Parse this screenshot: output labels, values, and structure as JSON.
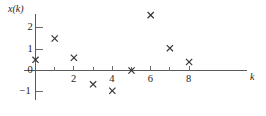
{
  "chart_data": {
    "type": "scatter",
    "title": "",
    "subtitle": "",
    "xlabel": "k",
    "ylabel": "x(k)",
    "marker": "x",
    "grid": false,
    "legend": null,
    "xlim": [
      -0.6,
      9.2
    ],
    "ylim": [
      -1.45,
      2.95
    ],
    "xticks": [
      2,
      4,
      6,
      8
    ],
    "xtick_labels": [
      "2",
      "4",
      "6",
      "8"
    ],
    "xticks_minor": [
      1,
      3,
      5,
      7
    ],
    "yticks": [
      -1,
      0,
      1,
      2
    ],
    "ytick_labels": [
      "−1",
      "0",
      "1",
      "2"
    ],
    "x": [
      0,
      1,
      2,
      3,
      4,
      5,
      6,
      7,
      8
    ],
    "values": [
      0.5,
      1.5,
      0.6,
      -0.65,
      -0.95,
      0.0,
      2.6,
      1.05,
      0.4
    ],
    "points": [
      {
        "k": 0,
        "v": 0.5
      },
      {
        "k": 1,
        "v": 1.5
      },
      {
        "k": 2,
        "v": 0.6
      },
      {
        "k": 3,
        "v": -0.65
      },
      {
        "k": 4,
        "v": -0.95
      },
      {
        "k": 5,
        "v": 0.0
      },
      {
        "k": 6,
        "v": 2.6
      },
      {
        "k": 7,
        "v": 1.05
      },
      {
        "k": 8,
        "v": 0.4
      }
    ]
  },
  "axes": {
    "y_title": "x(k)",
    "x_title": "k"
  },
  "colors": {
    "marker": "#333333",
    "axis": "#5a5a5a",
    "tick": "#6b6b6b",
    "background": "#ffffff",
    "text": "#1d1d1d"
  }
}
